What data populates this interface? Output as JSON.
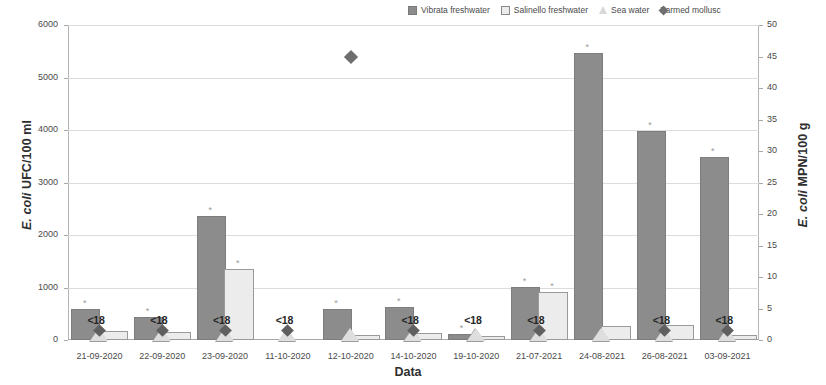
{
  "chart_data": {
    "type": "bar",
    "title": "",
    "xlabel": "Data",
    "ylabel": "E. coli UFC/100 ml",
    "y2label": "E. coli MPN/100 g",
    "ylim": [
      0,
      6000
    ],
    "y2lim": [
      0,
      50
    ],
    "grid": true,
    "legend_position": "top-right",
    "categories": [
      "21-09-2020",
      "22-09-2020",
      "23-09-2020",
      "11-10-2020",
      "12-10-2020",
      "14-10-2020",
      "19-10-2020",
      "21-07-2021",
      "24-08-2021",
      "26-08-2021",
      "03-09-2021"
    ],
    "yticks": [
      "0",
      "1000",
      "2000",
      "3000",
      "4000",
      "5000",
      "6000"
    ],
    "y2ticks": [
      "0",
      "5",
      "10",
      "15",
      "20",
      "25",
      "30",
      "35",
      "40",
      "45",
      "50"
    ],
    "series": [
      {
        "name": "Vibrata freshwater",
        "axis": "left",
        "color": "#8c8c8c",
        "marker": "filled-square",
        "values": [
          560,
          400,
          2320,
          0,
          560,
          600,
          70,
          980,
          5420,
          3940,
          3450
        ]
      },
      {
        "name": "Salinello freshwater",
        "axis": "left",
        "color": "#ececec",
        "marker": "open-square",
        "values": [
          140,
          120,
          1310,
          0,
          60,
          100,
          40,
          870,
          230,
          250,
          60
        ]
      },
      {
        "name": "Sea water",
        "axis": "right",
        "color": "#dedede",
        "marker": "triangle",
        "values": [
          0,
          0,
          0,
          0,
          0,
          0,
          0,
          0,
          0,
          0,
          0
        ]
      },
      {
        "name": "Farmed mollusc",
        "axis": "right",
        "color": "#6e6e6e",
        "marker": "diamond",
        "values": [
          1.5,
          1.5,
          1.5,
          1.5,
          45,
          1.5,
          null,
          1.5,
          null,
          1.5,
          1.5
        ]
      }
    ],
    "annotations": {
      "below_detection_label": "<18",
      "below_detection_categories": [
        "21-09-2020",
        "22-09-2020",
        "23-09-2020",
        "11-10-2020",
        "14-10-2020",
        "19-10-2020",
        "21-07-2021",
        "26-08-2021",
        "03-09-2021"
      ],
      "significance_marker": "*"
    }
  },
  "axes": {
    "left_title_prefix": "E. coli",
    "left_title_suffix": " UFC/100 ml",
    "right_title_prefix": "E. coli",
    "right_title_suffix": " MPN/100 g",
    "x_title": "Data"
  },
  "legend": {
    "items": [
      {
        "label": "Vibrata freshwater",
        "icon": "filled-square-icon"
      },
      {
        "label": "Salinello freshwater",
        "icon": "open-square-icon"
      },
      {
        "label": "Sea water",
        "icon": "triangle-icon"
      },
      {
        "label": "Farmed mollusc",
        "icon": "diamond-icon"
      }
    ]
  }
}
